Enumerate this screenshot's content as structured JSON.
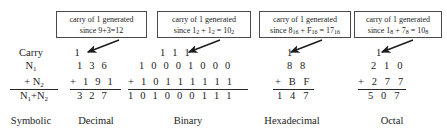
{
  "figure": {
    "ink_color": "#1c1c1c",
    "rule_color": "#2a2a2a",
    "box_border_color": "#4a4a4a",
    "background": "#ffffff"
  },
  "row_labels": {
    "carry": "Carry",
    "n1": "N",
    "n1_sub": "1",
    "n2_plus": "+ ",
    "n2": "N",
    "n2_sub": "2",
    "sum_a": "N",
    "sum_a_sub": "1",
    "sum_plus": "+N",
    "sum_b_sub": "2"
  },
  "callouts": [
    {
      "id": "decimal-callout",
      "line1": "carry of 1 generated",
      "line2_pre": "since   9+3=12",
      "line2_parts": []
    },
    {
      "id": "binary-callout",
      "line1": "carry of 1 generated",
      "line2_pre": "since  1",
      "sub1": "2",
      "mid1": " + 1",
      "sub2": "2",
      "mid2": " = 10",
      "sub3": "2"
    },
    {
      "id": "hex-callout",
      "line1": "carry of 1 generated",
      "line2_pre": "since  8",
      "sub1": "16",
      "mid1": " + F",
      "sub2": "16",
      "mid2": " = 17",
      "sub3": "16"
    },
    {
      "id": "octal-callout",
      "line1": "carry of 1 generated",
      "line2_pre": "since  1",
      "sub1": "8",
      "mid1": " + 7",
      "sub2": "8",
      "mid2": " = 10",
      "sub3": "8"
    }
  ],
  "columns": {
    "decimal": {
      "caption": "Decimal",
      "carry": "1",
      "n1": "1 3 6",
      "n2": "+ 1 9 1",
      "sum": "3 2 7"
    },
    "binary": {
      "caption": "Binary",
      "carry": "1 1 1",
      "n1": "1 0 0 0 1 0 0 0",
      "n2": "+ 1 0 1 1 1 1 1 1",
      "sum": "1 0 1 0 0 0 1 1 1"
    },
    "hexadecimal": {
      "caption": "Hexadecimal",
      "carry": "1",
      "n1": "8 8",
      "n2": "+ B F",
      "sum": "1 4 7"
    },
    "octal": {
      "caption": "Octal",
      "carry": "1",
      "n1": "2 1 0",
      "n2": "+ 2 7 7",
      "sum": "5 0 7"
    }
  },
  "captions": {
    "symbolic": "Symbolic"
  }
}
